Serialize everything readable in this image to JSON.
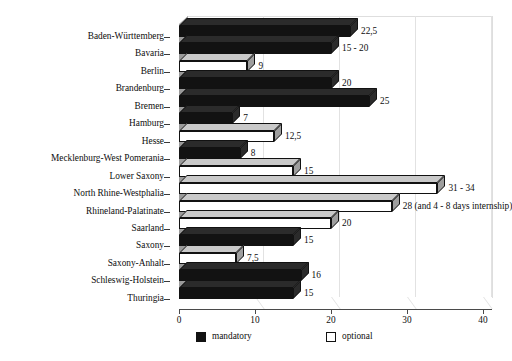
{
  "chart_data": {
    "type": "bar",
    "orientation": "horizontal",
    "title": "",
    "subtitle": "",
    "xlabel": "",
    "ylabel": "",
    "xlim": [
      0,
      40
    ],
    "xticks": [
      0,
      10,
      20,
      30,
      40
    ],
    "xtick_labels": [
      "0",
      "10",
      "20",
      "30",
      "40"
    ],
    "grid": true,
    "grid_axis": "x",
    "legend_position": "bottom",
    "style": "3d-bar",
    "categories": [
      "Baden-Württemberg",
      "Bavaria",
      "Berlin",
      "Brandenburg",
      "Bremen",
      "Hamburg",
      "Hesse",
      "Mecklenburg-West Pomerania",
      "Lower Saxony",
      "North Rhine-Westphalia",
      "Rhineland-Palatinate",
      "Saarland",
      "Saxony",
      "Saxony-Anhalt",
      "Schleswig-Holstein",
      "Thuringia"
    ],
    "series": [
      {
        "name": "mandatory",
        "color": "#121212",
        "values": [
          22.5,
          20,
          null,
          20,
          25,
          7,
          null,
          8,
          null,
          null,
          null,
          null,
          15,
          null,
          16,
          15
        ]
      },
      {
        "name": "optional",
        "color": "#ffffff",
        "values": [
          null,
          null,
          9,
          null,
          null,
          null,
          12.5,
          null,
          15,
          34,
          28,
          20,
          null,
          7.5,
          null,
          null
        ]
      }
    ],
    "bars": [
      {
        "category": "Baden-Württemberg",
        "series": "mandatory",
        "value": 22.5,
        "label": "22,5"
      },
      {
        "category": "Bavaria",
        "series": "mandatory",
        "value": 20,
        "label": "15 - 20"
      },
      {
        "category": "Berlin",
        "series": "optional",
        "value": 9,
        "label": "9"
      },
      {
        "category": "Brandenburg",
        "series": "mandatory",
        "value": 20,
        "label": "20"
      },
      {
        "category": "Bremen",
        "series": "mandatory",
        "value": 25,
        "label": "25"
      },
      {
        "category": "Hamburg",
        "series": "mandatory",
        "value": 7,
        "label": "7"
      },
      {
        "category": "Hesse",
        "series": "optional",
        "value": 12.5,
        "label": "12,5"
      },
      {
        "category": "Mecklenburg-West Pomerania",
        "series": "mandatory",
        "value": 8,
        "label": "8"
      },
      {
        "category": "Lower Saxony",
        "series": "optional",
        "value": 15,
        "label": "15"
      },
      {
        "category": "North Rhine-Westphalia",
        "series": "optional",
        "value": 34,
        "label": "31 - 34"
      },
      {
        "category": "Rhineland-Palatinate",
        "series": "optional",
        "value": 28,
        "label": "28 (and 4 - 8 days internship)"
      },
      {
        "category": "Saarland",
        "series": "optional",
        "value": 20,
        "label": "20"
      },
      {
        "category": "Saxony",
        "series": "mandatory",
        "value": 15,
        "label": "15"
      },
      {
        "category": "Saxony-Anhalt",
        "series": "optional",
        "value": 7.5,
        "label": "7,5"
      },
      {
        "category": "Schleswig-Holstein",
        "series": "mandatory",
        "value": 16,
        "label": "16"
      },
      {
        "category": "Thuringia",
        "series": "mandatory",
        "value": 15,
        "label": "15"
      }
    ],
    "legend": [
      {
        "label": "mandatory",
        "series": "mandatory",
        "color": "#121212"
      },
      {
        "label": "optional",
        "series": "optional",
        "color": "#ffffff"
      }
    ]
  }
}
